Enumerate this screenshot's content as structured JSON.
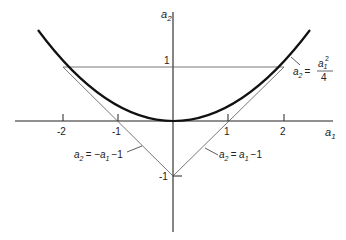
{
  "diagram": {
    "axes": {
      "x_label": "a",
      "x_sub": "1",
      "y_label": "a",
      "y_sub": "2",
      "x_ticks": [
        "-2",
        "-1",
        "1",
        "2"
      ],
      "y_ticks": [
        "1",
        "-1"
      ]
    },
    "curves": [
      {
        "name": "parabola",
        "label_lhs": "a",
        "label_lhs_sub": "2",
        "label_eq": "=",
        "label_num": "a",
        "label_num_sub": "1",
        "label_num_sup": "2",
        "label_den": "4"
      },
      {
        "name": "line-left",
        "label": "a",
        "label_sub": "2",
        "label_rest": "= −a",
        "label_rest_sub": "1",
        "label_tail": "−1"
      },
      {
        "name": "line-right",
        "label": "a",
        "label_sub": "2",
        "label_rest": "= a",
        "label_rest_sub": "1",
        "label_tail": "−1"
      },
      {
        "name": "horizontal-line",
        "value": "a2 = 1"
      }
    ],
    "colors": {
      "axis": "#222222",
      "curve": "#111111",
      "thin_line": "#555555"
    }
  }
}
